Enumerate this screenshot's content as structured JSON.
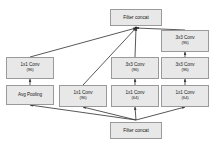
{
  "diagram": {
    "colors": {
      "node_fill": "#e8e8e8",
      "node_border": "#9a9a9a",
      "edge": "#3a3a3a",
      "background": "#ffffff",
      "text": "#1a1a1a"
    },
    "nodes": [
      {
        "id": "concat-top",
        "label": "Filter concat",
        "sub": "",
        "x": 110,
        "y": 9,
        "w": 52,
        "h": 17
      },
      {
        "id": "conv3x3-right-top",
        "label": "3x3 Conv",
        "sub": "(96)",
        "x": 161,
        "y": 30,
        "w": 48,
        "h": 22
      },
      {
        "id": "conv1x1-left",
        "label": "1x1 Conv",
        "sub": "(96)",
        "x": 6,
        "y": 57,
        "w": 48,
        "h": 22
      },
      {
        "id": "conv3x3-mid",
        "label": "3x3 Conv",
        "sub": "(96)",
        "x": 111,
        "y": 57,
        "w": 48,
        "h": 22
      },
      {
        "id": "conv3x3-right-bottom",
        "label": "3x3 Conv",
        "sub": "(96)",
        "x": 161,
        "y": 57,
        "w": 48,
        "h": 22
      },
      {
        "id": "avg-pooling",
        "label": "Avg Pooling",
        "sub": "",
        "x": 6,
        "y": 85,
        "w": 48,
        "h": 20
      },
      {
        "id": "conv1x1-second",
        "label": "1x1 Conv",
        "sub": "(96)",
        "x": 59,
        "y": 85,
        "w": 48,
        "h": 22
      },
      {
        "id": "conv1x1-mid",
        "label": "1x1 Conv",
        "sub": "(64)",
        "x": 111,
        "y": 85,
        "w": 48,
        "h": 22
      },
      {
        "id": "conv1x1-right",
        "label": "1x1 Conv",
        "sub": "(64)",
        "x": 161,
        "y": 85,
        "w": 48,
        "h": 22
      },
      {
        "id": "concat-bottom",
        "label": "Filter concat",
        "sub": "",
        "x": 110,
        "y": 122,
        "w": 52,
        "h": 17
      }
    ],
    "edges": [
      {
        "from": "conv1x1-left",
        "to": "concat-top"
      },
      {
        "from": "conv1x1-second",
        "to": "concat-top"
      },
      {
        "from": "conv3x3-mid",
        "to": "concat-top"
      },
      {
        "from": "conv3x3-right-top",
        "to": "concat-top"
      },
      {
        "from": "conv3x3-right-bottom",
        "to": "conv3x3-right-top"
      },
      {
        "from": "avg-pooling",
        "to": "conv1x1-left"
      },
      {
        "from": "conv1x1-mid",
        "to": "conv3x3-mid"
      },
      {
        "from": "conv1x1-right",
        "to": "conv3x3-right-bottom"
      },
      {
        "from": "concat-bottom",
        "to": "avg-pooling"
      },
      {
        "from": "concat-bottom",
        "to": "conv1x1-second"
      },
      {
        "from": "concat-bottom",
        "to": "conv1x1-mid"
      },
      {
        "from": "concat-bottom",
        "to": "conv1x1-right"
      }
    ]
  }
}
